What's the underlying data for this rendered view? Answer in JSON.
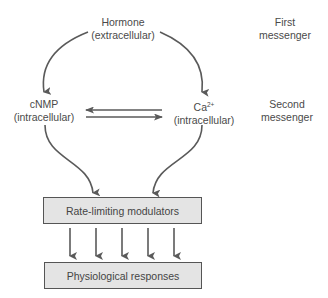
{
  "diagram": {
    "hormone": {
      "line1": "Hormone",
      "line2": "(extracellular)"
    },
    "first_messenger": {
      "line1": "First",
      "line2": "messenger"
    },
    "cnmp": {
      "line1": "cNMP",
      "line2": "(intracellular)"
    },
    "calcium": {
      "base": "Ca",
      "sup": "2+",
      "line2": "(intracellular)"
    },
    "second_messenger": {
      "line1": "Second",
      "line2": "messenger"
    },
    "rate_box": "Rate-limiting modulators",
    "response_box": "Physiological responses",
    "arrow_color": "#5a5a5a",
    "box_fill": "#e4e4e4"
  }
}
